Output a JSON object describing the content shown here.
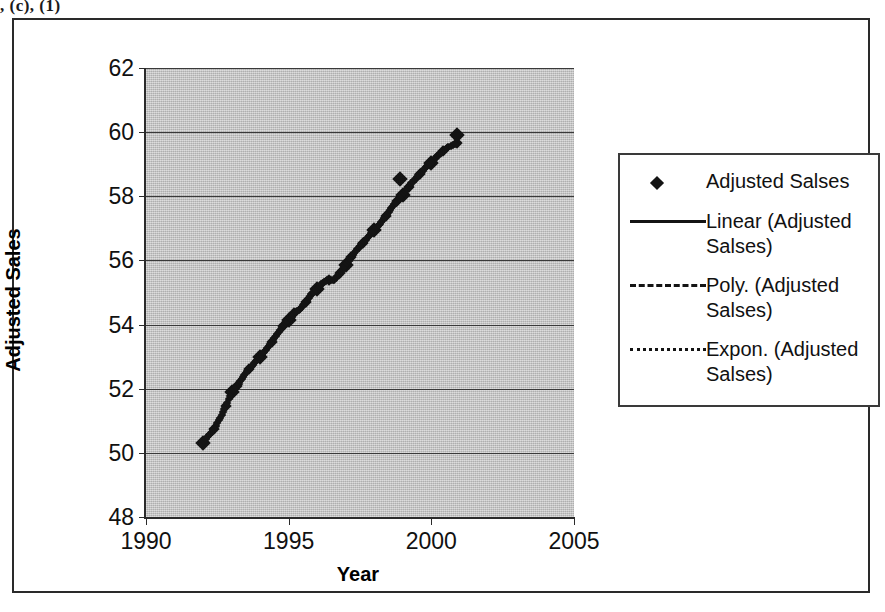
{
  "top_fragment": ", (c), (1)",
  "chart_data": {
    "type": "scatter",
    "title": "",
    "xlabel": "Year",
    "ylabel": "Adjusted Sales",
    "xlim": [
      1990,
      2005
    ],
    "ylim": [
      48,
      62
    ],
    "xticks": [
      1990,
      1995,
      2000,
      2005
    ],
    "yticks": [
      48,
      50,
      52,
      54,
      56,
      58,
      60,
      62
    ],
    "grid": true,
    "plot_background": "#bfbfbf",
    "marker_color": "#141414",
    "legend_position": "right",
    "series": [
      {
        "name": "Adjusted Salses",
        "style": "marker",
        "marker": "diamond",
        "x": [
          1992.0,
          1992.2,
          1992.4,
          1992.6,
          1992.8,
          1993.0,
          1993.2,
          1993.4,
          1993.6,
          1993.8,
          1994.0,
          1994.2,
          1994.4,
          1994.6,
          1994.8,
          1995.0,
          1995.2,
          1995.4,
          1995.6,
          1995.8,
          1996.0,
          1996.2,
          1996.4,
          1996.6,
          1996.8,
          1997.0,
          1997.2,
          1997.4,
          1997.6,
          1997.8,
          1998.0,
          1998.2,
          1998.4,
          1998.6,
          1998.8,
          1999.0,
          1999.2,
          1999.4,
          1999.6,
          1999.8,
          2000.0,
          2000.2,
          2000.4,
          2000.6,
          2000.9
        ],
        "y": [
          50.3,
          50.55,
          50.75,
          51.1,
          51.45,
          51.9,
          52.1,
          52.35,
          52.6,
          52.8,
          53.0,
          53.2,
          53.45,
          53.7,
          53.95,
          54.15,
          54.35,
          54.5,
          54.7,
          54.95,
          55.1,
          55.3,
          55.4,
          55.4,
          55.6,
          55.85,
          56.1,
          56.35,
          56.55,
          56.75,
          56.95,
          57.15,
          57.4,
          57.65,
          57.85,
          58.05,
          58.3,
          58.5,
          58.7,
          58.9,
          59.05,
          59.25,
          59.4,
          59.55,
          59.65
        ],
        "outliers": [
          {
            "x": 1998.9,
            "y": 58.55
          },
          {
            "x": 2000.9,
            "y": 59.9
          }
        ]
      },
      {
        "name": "Linear (Adjusted Salses)",
        "style": "solid-line"
      },
      {
        "name": "Poly. (Adjusted Salses)",
        "style": "dashed-line"
      },
      {
        "name": "Expon. (Adjusted Salses)",
        "style": "dotted-line"
      }
    ]
  },
  "axes": {
    "y_title": "Adjusted Sales",
    "x_title": "Year",
    "y_tick_labels": [
      "62",
      "60",
      "58",
      "56",
      "54",
      "52",
      "50",
      "48"
    ],
    "x_tick_labels": [
      "1990",
      "1995",
      "2000",
      "2005"
    ]
  },
  "legend": {
    "entries": [
      {
        "label": "Adjusted Salses",
        "key": "diamond-marker"
      },
      {
        "label": "Linear (Adjusted Salses)",
        "key": "solid-line"
      },
      {
        "label": "Poly. (Adjusted Salses)",
        "key": "dashed-line"
      },
      {
        "label": "Expon. (Adjusted Salses)",
        "key": "dotted-line"
      }
    ]
  }
}
